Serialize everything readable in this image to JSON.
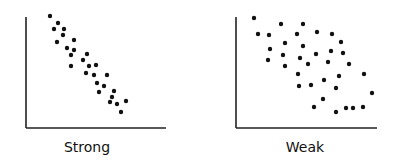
{
  "chart_data": [
    {
      "type": "scatter",
      "title": "Strong",
      "xlabel": "",
      "ylabel": "",
      "grid": false,
      "trend": "negative",
      "points": [
        [
          50,
          16
        ],
        [
          58,
          23
        ],
        [
          54,
          29
        ],
        [
          64,
          29
        ],
        [
          63,
          35
        ],
        [
          57,
          42
        ],
        [
          74,
          40
        ],
        [
          67,
          48
        ],
        [
          74,
          50
        ],
        [
          71,
          55
        ],
        [
          87,
          54
        ],
        [
          83,
          60
        ],
        [
          71,
          66
        ],
        [
          89,
          66
        ],
        [
          96,
          65
        ],
        [
          86,
          73
        ],
        [
          94,
          75
        ],
        [
          107,
          75
        ],
        [
          97,
          83
        ],
        [
          104,
          86
        ],
        [
          99,
          92
        ],
        [
          114,
          91
        ],
        [
          112,
          97
        ],
        [
          110,
          102
        ],
        [
          117,
          104
        ],
        [
          126,
          101
        ],
        [
          121,
          112
        ]
      ]
    },
    {
      "type": "scatter",
      "title": "Weak",
      "xlabel": "",
      "ylabel": "",
      "grid": false,
      "trend": "negative",
      "points": [
        [
          254,
          18
        ],
        [
          281,
          24
        ],
        [
          303,
          24
        ],
        [
          258,
          34
        ],
        [
          269,
          35
        ],
        [
          297,
          34
        ],
        [
          317,
          32
        ],
        [
          332,
          34
        ],
        [
          285,
          43
        ],
        [
          303,
          46
        ],
        [
          341,
          42
        ],
        [
          270,
          49
        ],
        [
          283,
          55
        ],
        [
          316,
          54
        ],
        [
          331,
          51
        ],
        [
          343,
          53
        ],
        [
          268,
          60
        ],
        [
          300,
          58
        ],
        [
          308,
          64
        ],
        [
          328,
          62
        ],
        [
          285,
          66
        ],
        [
          349,
          64
        ],
        [
          298,
          74
        ],
        [
          364,
          74
        ],
        [
          339,
          76
        ],
        [
          324,
          80
        ],
        [
          299,
          86
        ],
        [
          311,
          85
        ],
        [
          336,
          88
        ],
        [
          372,
          93
        ],
        [
          323,
          99
        ],
        [
          314,
          107
        ],
        [
          346,
          108
        ],
        [
          353,
          108
        ],
        [
          363,
          107
        ],
        [
          336,
          112
        ]
      ]
    }
  ],
  "labels": {
    "strong": "Strong",
    "weak": "Weak"
  },
  "colors": {
    "dot": "#111111",
    "axis": "#222222"
  }
}
